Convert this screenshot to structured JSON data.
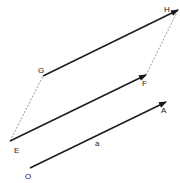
{
  "diagram": {
    "title": "",
    "points": {
      "O": "O",
      "A": "A",
      "E": "E",
      "F": "F",
      "G": "G",
      "H": "H"
    },
    "vectors": [
      {
        "from": "O",
        "to": "A",
        "label": "a"
      },
      {
        "from": "E",
        "to": "F",
        "label": ""
      },
      {
        "from": "G",
        "to": "H",
        "label": ""
      }
    ],
    "dashed_segments": [
      {
        "from": "E",
        "to": "G"
      },
      {
        "from": "F",
        "to": "H"
      }
    ],
    "vector_label": "a",
    "colors": {
      "line": "#1a1a1a",
      "dashed": "#555555",
      "background": "#ffffff"
    }
  }
}
